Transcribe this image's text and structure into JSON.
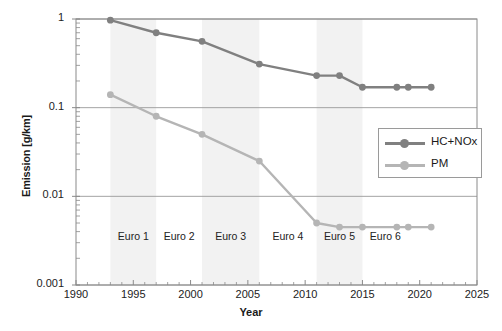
{
  "chart_data": {
    "type": "line",
    "title": "",
    "xlabel": "Year",
    "ylabel": "Emission [g/km]",
    "xlim": [
      1990,
      2025
    ],
    "ylim": [
      0.001,
      1
    ],
    "yscale": "log",
    "grid": true,
    "legend_position": "center-right",
    "x_ticks": [
      1990,
      1995,
      2000,
      2005,
      2010,
      2015,
      2020,
      2025
    ],
    "x_tick_labels": [
      "1990",
      "1995",
      "2000",
      "2005",
      "2010",
      "2015",
      "2020",
      "2025"
    ],
    "y_ticks": [
      1,
      0.1,
      0.01,
      0.001
    ],
    "y_tick_labels": [
      "1",
      "0.1",
      "0.01",
      "0.001"
    ],
    "series": [
      {
        "name": "HC+NOx",
        "color": "#808080",
        "x": [
          1993,
          1997,
          2001,
          2006,
          2011,
          2013,
          2015,
          2018,
          2019,
          2021
        ],
        "values": [
          0.97,
          0.7,
          0.56,
          0.31,
          0.23,
          0.23,
          0.17,
          0.17,
          0.17,
          0.17
        ]
      },
      {
        "name": "PM",
        "color": "#b5b5b5",
        "x": [
          1993,
          1997,
          2001,
          2006,
          2011,
          2013,
          2015,
          2018,
          2019,
          2021
        ],
        "values": [
          0.14,
          0.08,
          0.05,
          0.025,
          0.005,
          0.0045,
          0.0045,
          0.0045,
          0.0045,
          0.0045
        ]
      }
    ],
    "bands": [
      {
        "label": "Euro 1",
        "start": 1993,
        "end": 1997,
        "shaded": true
      },
      {
        "label": "Euro 2",
        "start": 1997,
        "end": 2001,
        "shaded": false
      },
      {
        "label": "Euro 3",
        "start": 2001,
        "end": 2006,
        "shaded": true
      },
      {
        "label": "Euro 4",
        "start": 2006,
        "end": 2011,
        "shaded": false
      },
      {
        "label": "Euro 5",
        "start": 2011,
        "end": 2015,
        "shaded": true
      },
      {
        "label": "Euro 6",
        "start": 2015,
        "end": 2019,
        "shaded": false
      }
    ],
    "band_shade_color": "#f2f2f2",
    "axis_color": "#8a8a8a",
    "grid_color": "#9a9a9a"
  }
}
